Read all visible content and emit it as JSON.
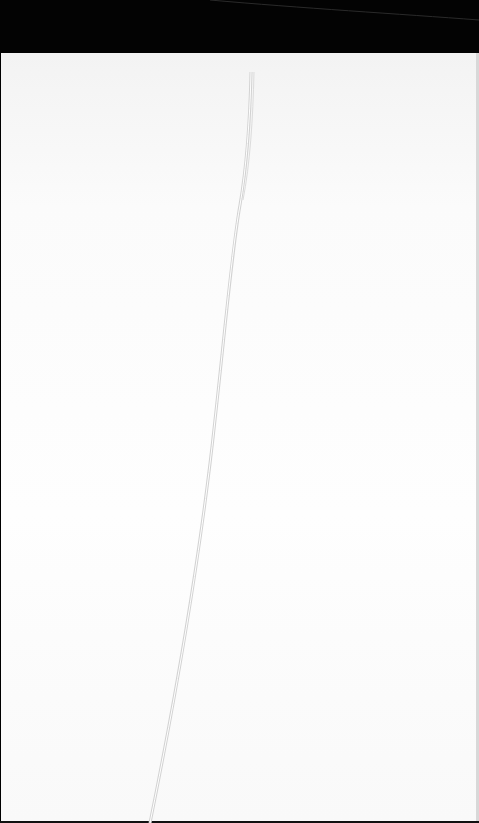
{
  "scene": {
    "description": "Thin white strand lying on white paper, dark background band at top",
    "colors": {
      "background_band": "#030303",
      "paper": "#fdfdfd",
      "strand": "#d9d9d9",
      "strand_highlight": "#ffffff"
    },
    "strand_path": "M251 72 C250 120 246 170 240 205 C232 250 225 330 215 420 C200 560 175 700 150 823"
  }
}
